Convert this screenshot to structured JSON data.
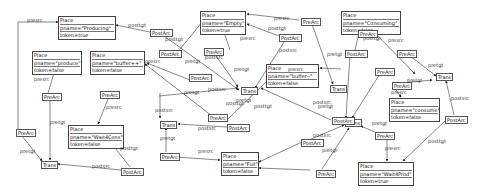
{
  "diagram": {
    "places": [
      {
        "id": "p_producing",
        "x": 58,
        "y": 16,
        "w": 58,
        "header": "Place",
        "name": "pname=\"Producing\"",
        "token": "token=true"
      },
      {
        "id": "p_produce",
        "x": 32,
        "y": 51,
        "w": 50,
        "header": "Place",
        "name": "pname=\"produce\"",
        "token": "token=false"
      },
      {
        "id": "p_bufferpp",
        "x": 90,
        "y": 51,
        "w": 55,
        "header": "Place",
        "name": "pname=\"buffer++\"",
        "token": "token=false"
      },
      {
        "id": "p_empty",
        "x": 200,
        "y": 11,
        "w": 46,
        "header": "Place",
        "name": "pname=\"Empty\"",
        "token": "token=true"
      },
      {
        "id": "p_consuming",
        "x": 341,
        "y": 11,
        "w": 60,
        "header": "Place",
        "name": "pname=\"Consuming\"",
        "token": "token=false"
      },
      {
        "id": "p_buffermm",
        "x": 266,
        "y": 64,
        "w": 53,
        "header": "Place",
        "name": "pname=\"buffer--\"",
        "token": "token=false"
      },
      {
        "id": "p_consume",
        "x": 389,
        "y": 98,
        "w": 51,
        "header": "Place",
        "name": "pname=\"consume\"",
        "token": "token=false"
      },
      {
        "id": "p_wait4cons",
        "x": 68,
        "y": 125,
        "w": 56,
        "header": "Place",
        "name": "pname=\"Wait4Cons\"",
        "token": "token=false"
      },
      {
        "id": "p_full",
        "x": 221,
        "y": 152,
        "w": 38,
        "header": "Place",
        "name": "pname=\"Full\"",
        "token": "token=false"
      },
      {
        "id": "p_wait4prod",
        "x": 358,
        "y": 162,
        "w": 56,
        "header": "Place",
        "name": "pname=\"Wait4Prod\"",
        "token": "token=true"
      }
    ],
    "transitions": [
      {
        "id": "t1",
        "x": 41,
        "y": 161,
        "label": "Trans"
      },
      {
        "id": "t2",
        "x": 160,
        "y": 121,
        "label": "Trans"
      },
      {
        "id": "t3",
        "x": 241,
        "y": 87,
        "label": "Trans"
      },
      {
        "id": "t4",
        "x": 330,
        "y": 85,
        "label": "Trans"
      },
      {
        "id": "t5",
        "x": 345,
        "y": 119,
        "label": "Trans"
      },
      {
        "id": "t6",
        "x": 436,
        "y": 73,
        "label": "Trans"
      }
    ],
    "arcs": [
      {
        "id": "a1",
        "type": "PreArc",
        "x": 16,
        "y": 129
      },
      {
        "id": "a2",
        "type": "PreArc",
        "x": 42,
        "y": 93
      },
      {
        "id": "a3",
        "type": "PostArc",
        "x": 121,
        "y": 168
      },
      {
        "id": "a4",
        "type": "PostArc",
        "x": 150,
        "y": 29
      },
      {
        "id": "a5",
        "type": "PreArc",
        "x": 100,
        "y": 91
      },
      {
        "id": "a6",
        "type": "PostArc",
        "x": 159,
        "y": 50
      },
      {
        "id": "a7",
        "type": "PostArc",
        "x": 189,
        "y": 74
      },
      {
        "id": "a8",
        "type": "PreArc",
        "x": 204,
        "y": 48
      },
      {
        "id": "a9",
        "type": "PreArc",
        "x": 208,
        "y": 114
      },
      {
        "id": "a10",
        "type": "PostArc",
        "x": 227,
        "y": 124
      },
      {
        "id": "a11",
        "type": "PreArc",
        "x": 160,
        "y": 153
      },
      {
        "id": "a12",
        "type": "PreArc",
        "x": 301,
        "y": 18
      },
      {
        "id": "a13",
        "type": "PostArc",
        "x": 279,
        "y": 34
      },
      {
        "id": "a14",
        "type": "PostArc",
        "x": 332,
        "y": 117
      },
      {
        "id": "a15",
        "type": "PostArc",
        "x": 301,
        "y": 139
      },
      {
        "id": "a16",
        "type": "PostArc",
        "x": 345,
        "y": 50
      },
      {
        "id": "a17",
        "type": "PreArc",
        "x": 375,
        "y": 68
      },
      {
        "id": "a18",
        "type": "PreArc",
        "x": 397,
        "y": 50
      },
      {
        "id": "a19",
        "type": "PreArc",
        "x": 392,
        "y": 82
      },
      {
        "id": "a20",
        "type": "PreArc",
        "x": 375,
        "y": 132
      },
      {
        "id": "a21",
        "type": "PreArc",
        "x": 316,
        "y": 170
      },
      {
        "id": "a22",
        "type": "PostArc",
        "x": 445,
        "y": 116
      },
      {
        "id": "a23",
        "type": "PreArc",
        "x": 358,
        "y": 30
      }
    ],
    "edge_labels": [
      {
        "text": "presrc",
        "x": 27,
        "y": 17
      },
      {
        "text": "posttgt",
        "x": 128,
        "y": 22
      },
      {
        "text": "presrc",
        "x": 34,
        "y": 76
      },
      {
        "text": "pretgt",
        "x": 50,
        "y": 119
      },
      {
        "text": "pretgt",
        "x": 20,
        "y": 148
      },
      {
        "text": "postsrc",
        "x": 92,
        "y": 163
      },
      {
        "text": "presrc",
        "x": 106,
        "y": 104
      },
      {
        "text": "posttgt",
        "x": 120,
        "y": 145
      },
      {
        "text": "postsrc",
        "x": 155,
        "y": 107
      },
      {
        "text": "pretgt",
        "x": 160,
        "y": 135
      },
      {
        "text": "presrc",
        "x": 145,
        "y": 58
      },
      {
        "text": "posttgt",
        "x": 165,
        "y": 36
      },
      {
        "text": "pretgt",
        "x": 185,
        "y": 58
      },
      {
        "text": "postsrc",
        "x": 205,
        "y": 54
      },
      {
        "text": "postsrc",
        "x": 208,
        "y": 86
      },
      {
        "text": "pretgt",
        "x": 184,
        "y": 89
      },
      {
        "text": "presrc",
        "x": 198,
        "y": 148
      },
      {
        "text": "postsrc",
        "x": 198,
        "y": 125
      },
      {
        "text": "posttgt",
        "x": 226,
        "y": 100
      },
      {
        "text": "pretgt",
        "x": 236,
        "y": 97
      },
      {
        "text": "posttgt",
        "x": 254,
        "y": 103
      },
      {
        "text": "presrc",
        "x": 274,
        "y": 15
      },
      {
        "text": "posttgt",
        "x": 268,
        "y": 25
      },
      {
        "text": "presrc",
        "x": 240,
        "y": 35
      },
      {
        "text": "pretgt",
        "x": 234,
        "y": 66
      },
      {
        "text": "presrc",
        "x": 288,
        "y": 66
      },
      {
        "text": "postsrc",
        "x": 279,
        "y": 47
      },
      {
        "text": "pretgt",
        "x": 327,
        "y": 51
      },
      {
        "text": "postsrc",
        "x": 313,
        "y": 99
      },
      {
        "text": "pretgt",
        "x": 318,
        "y": 103
      },
      {
        "text": "postsrc",
        "x": 313,
        "y": 132
      },
      {
        "text": "pretgt",
        "x": 322,
        "y": 147
      },
      {
        "text": "presrc",
        "x": 388,
        "y": 37
      },
      {
        "text": "posttgt",
        "x": 363,
        "y": 35
      },
      {
        "text": "pretgt",
        "x": 428,
        "y": 62
      },
      {
        "text": "pretgt",
        "x": 407,
        "y": 77
      },
      {
        "text": "presrc",
        "x": 391,
        "y": 89
      },
      {
        "text": "pretgt",
        "x": 372,
        "y": 120
      },
      {
        "text": "presrc",
        "x": 385,
        "y": 145
      },
      {
        "text": "posttgt",
        "x": 428,
        "y": 138
      },
      {
        "text": "postsrc",
        "x": 451,
        "y": 95
      }
    ]
  }
}
